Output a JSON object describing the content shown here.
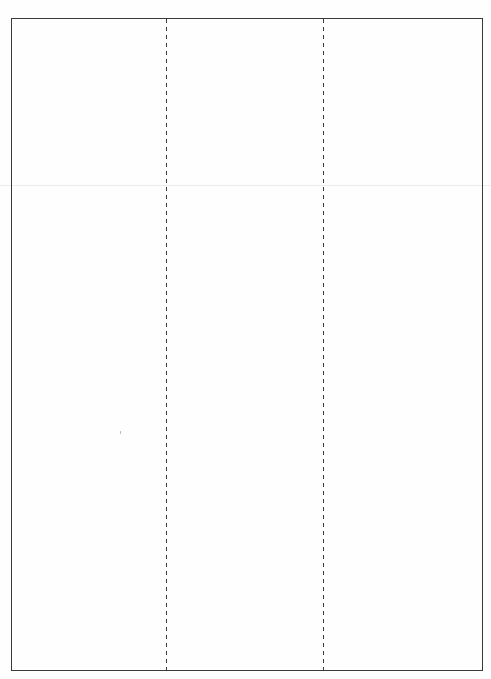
{
  "document": {
    "type": "blank tri-fold template",
    "columns": 3,
    "panels": [
      {
        "label": "panel-1",
        "text": ""
      },
      {
        "label": "panel-2",
        "text": ""
      },
      {
        "label": "panel-3",
        "text": ""
      }
    ],
    "fold_lines": [
      {
        "label": "fold-line-1",
        "style": "dashed"
      },
      {
        "label": "fold-line-2",
        "style": "dashed"
      }
    ],
    "colors": {
      "border": "#3a3a3a",
      "fold_line": "#3c3c3c",
      "background": "#fefefe",
      "crease": "#ececec"
    }
  }
}
